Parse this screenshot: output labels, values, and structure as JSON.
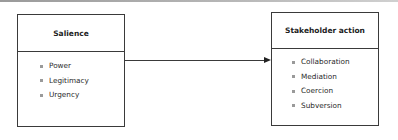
{
  "diagram": {
    "source_box": {
      "title": "Salience",
      "items": [
        "Power",
        "Legitimacy",
        "Urgency"
      ]
    },
    "target_box": {
      "title": "Stakeholder action",
      "items": [
        "Collaboration",
        "Mediation",
        "Coercion",
        "Subversion"
      ]
    },
    "connector": {
      "from": "Salience",
      "to": "Stakeholder action",
      "style": "arrow"
    },
    "colors": {
      "border": "#3a3a3a",
      "bullet": "#9a9a9a",
      "text": "#2a2a2a"
    }
  }
}
